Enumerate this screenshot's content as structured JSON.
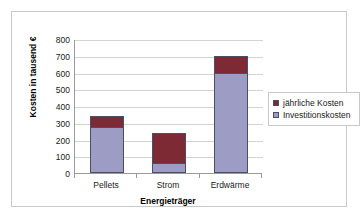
{
  "chart_data": {
    "type": "bar",
    "subtype": "stacked-column",
    "title": "",
    "xlabel": "Energieträger",
    "ylabel": "Kosten in tausend €",
    "categories": [
      "Pellets",
      "Strom",
      "Erdwärme"
    ],
    "series": [
      {
        "name": "jährliche Kosten",
        "color": "#7E2A34",
        "values": [
          65,
          180,
          105
        ]
      },
      {
        "name": "Investitionskosten",
        "color": "#9C9CC4",
        "values": [
          275,
          60,
          595
        ]
      }
    ],
    "totals": [
      340,
      240,
      700
    ],
    "stack_order": [
      "Investitionskosten",
      "jährliche Kosten"
    ],
    "ylim": [
      0,
      800
    ],
    "yticks": [
      0,
      100,
      200,
      300,
      400,
      500,
      600,
      700,
      800
    ],
    "ytick_labels": [
      "0",
      "100",
      "200",
      "300",
      "400",
      "500",
      "600",
      "700",
      "800"
    ],
    "grid": "horizontal",
    "legend_position": "right",
    "legend_entries": [
      "jährliche Kosten",
      "Investitionskosten"
    ]
  },
  "colors": {
    "annual_costs": "#7E2A34",
    "investment_costs": "#9C9CC4",
    "bar_outline": "#4D4D66",
    "gridline": "#D3D3D3",
    "axis_line": "#9A9A9A",
    "frame": "#C9C9C9",
    "background": "#FFFFFF",
    "text": "#1A1A1A"
  }
}
